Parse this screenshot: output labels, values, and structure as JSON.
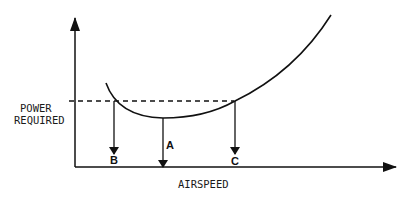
{
  "diagram": {
    "y_axis_label_line1": "POWER",
    "y_axis_label_line2": "REQUIRED",
    "x_axis_label": "AIRSPEED",
    "points": {
      "a": "A",
      "b": "B",
      "c": "C"
    },
    "colors": {
      "line": "#111111",
      "background": "#ffffff"
    }
  }
}
